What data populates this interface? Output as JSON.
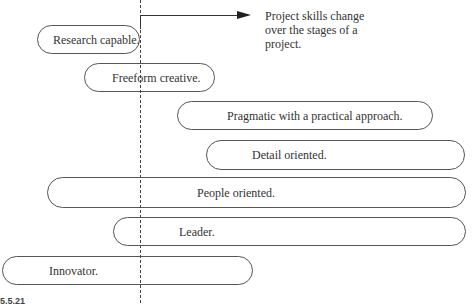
{
  "diagram": {
    "annotation": {
      "text": "Project skills change over the stages of a project.",
      "line1": "Project skills change",
      "line2": "over the stages of a",
      "line3": "project."
    },
    "skills": [
      {
        "label": "Research capable.",
        "left": 37,
        "top": 25,
        "width": 103,
        "height": 29,
        "text_left": 15
      },
      {
        "label": "Freeform creative.",
        "left": 84,
        "top": 63,
        "width": 131,
        "height": 29,
        "text_left": 27
      },
      {
        "label": "Pragmatic with a practical approach.",
        "left": 177,
        "top": 101,
        "width": 256,
        "height": 29,
        "text_left": 49
      },
      {
        "label": "Detail oriented.",
        "left": 206,
        "top": 140,
        "width": 259,
        "height": 30,
        "text_left": 45
      },
      {
        "label": "People oriented.",
        "left": 47,
        "top": 177,
        "width": 419,
        "height": 31,
        "text_left": 149
      },
      {
        "label": "Leader.",
        "left": 113,
        "top": 217,
        "width": 353,
        "height": 29,
        "text_left": 65
      },
      {
        "label": "Innovator.",
        "left": 2,
        "top": 256,
        "width": 251,
        "height": 29,
        "text_left": 46
      }
    ],
    "figure_label": "5.5.21",
    "colors": {
      "stroke": "#555555",
      "text": "#333333",
      "background": "#ffffff"
    }
  }
}
